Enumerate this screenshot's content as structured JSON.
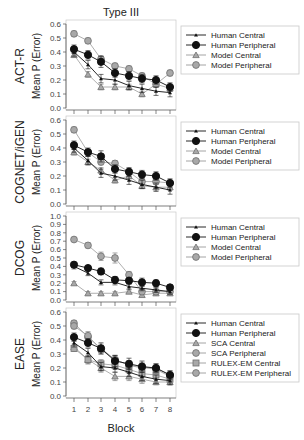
{
  "chart_data": {
    "type": "line",
    "title": "Type III",
    "xlabel": "Block",
    "ylabel": "Mean P (Error)",
    "x": [
      1,
      2,
      3,
      4,
      5,
      6,
      7,
      8
    ],
    "panels": [
      {
        "row_label": "ACT-R",
        "ylim": [
          0.0,
          0.6
        ],
        "yticks": [
          "0.0",
          "0.1",
          "0.2",
          "0.3",
          "0.4",
          "0.5",
          "0.6"
        ],
        "series": [
          {
            "name": "Human Central",
            "marker": "tri-small",
            "values": [
              0.4,
              0.31,
              0.21,
              0.2,
              0.16,
              0.14,
              0.12,
              0.11
            ],
            "err": [
              0.03,
              0.03,
              0.03,
              0.03,
              0.03,
              0.03,
              0.03,
              0.03
            ]
          },
          {
            "name": "Human Peripheral",
            "marker": "circle-black",
            "values": [
              0.42,
              0.38,
              0.33,
              0.25,
              0.23,
              0.21,
              0.2,
              0.15
            ],
            "err": [
              0.03,
              0.03,
              0.04,
              0.03,
              0.03,
              0.03,
              0.03,
              0.03
            ]
          },
          {
            "name": "Model Central",
            "marker": "tri-gray",
            "values": [
              0.38,
              0.24,
              0.15,
              0.15,
              0.15,
              0.1,
              0.17,
              0.14
            ],
            "err": [
              0.02,
              0.02,
              0.02,
              0.02,
              0.02,
              0.02,
              0.02,
              0.02
            ]
          },
          {
            "name": "Model Peripheral",
            "marker": "circle-gray",
            "values": [
              0.53,
              0.48,
              0.35,
              0.3,
              0.28,
              0.23,
              0.17,
              0.25
            ],
            "err": [
              0.02,
              0.02,
              0.02,
              0.02,
              0.02,
              0.02,
              0.02,
              0.02
            ]
          }
        ]
      },
      {
        "row_label": "COGNET/iGEN",
        "ylim": [
          0.0,
          0.6
        ],
        "yticks": [
          "0.0",
          "0.1",
          "0.2",
          "0.3",
          "0.4",
          "0.5",
          "0.6"
        ],
        "series": [
          {
            "name": "Human Central",
            "marker": "tri-small",
            "values": [
              0.4,
              0.31,
              0.22,
              0.2,
              0.17,
              0.14,
              0.12,
              0.1
            ],
            "err": [
              0.03,
              0.03,
              0.03,
              0.03,
              0.03,
              0.03,
              0.03,
              0.03
            ]
          },
          {
            "name": "Human Peripheral",
            "marker": "circle-black",
            "values": [
              0.42,
              0.37,
              0.34,
              0.25,
              0.23,
              0.21,
              0.2,
              0.15
            ],
            "err": [
              0.03,
              0.03,
              0.04,
              0.03,
              0.03,
              0.03,
              0.03,
              0.03
            ]
          },
          {
            "name": "Model Central",
            "marker": "tri-gray",
            "values": [
              0.37,
              0.3,
              0.24,
              0.17,
              0.2,
              0.13,
              0.12,
              0.12
            ],
            "err": [
              0.02,
              0.02,
              0.02,
              0.02,
              0.02,
              0.02,
              0.02,
              0.02
            ]
          },
          {
            "name": "Model Peripheral",
            "marker": "circle-gray",
            "values": [
              0.53,
              0.37,
              0.3,
              0.29,
              0.23,
              0.16,
              0.16,
              0.15
            ],
            "err": [
              0.02,
              0.02,
              0.02,
              0.02,
              0.02,
              0.02,
              0.02,
              0.02
            ]
          }
        ]
      },
      {
        "row_label": "DCOG",
        "ylim": [
          0.0,
          1.0
        ],
        "yticks": [
          "0.0",
          "0.1",
          "0.2",
          "0.3",
          "0.4",
          "0.5",
          "0.6",
          "0.7",
          "0.8",
          "0.9",
          "1.0"
        ],
        "series": [
          {
            "name": "Human Central",
            "marker": "tri-small",
            "values": [
              0.4,
              0.32,
              0.21,
              0.21,
              0.16,
              0.14,
              0.12,
              0.1
            ],
            "err": [
              0.03,
              0.03,
              0.03,
              0.03,
              0.03,
              0.03,
              0.03,
              0.03
            ]
          },
          {
            "name": "Human Peripheral",
            "marker": "circle-black",
            "values": [
              0.42,
              0.38,
              0.34,
              0.24,
              0.23,
              0.21,
              0.2,
              0.15
            ],
            "err": [
              0.03,
              0.03,
              0.04,
              0.04,
              0.04,
              0.05,
              0.04,
              0.03
            ]
          },
          {
            "name": "Model Central",
            "marker": "tri-gray",
            "values": [
              0.2,
              0.08,
              0.08,
              0.08,
              0.1,
              0.06,
              0.08,
              0.08
            ],
            "err": [
              0.02,
              0.02,
              0.02,
              0.02,
              0.02,
              0.02,
              0.02,
              0.02
            ]
          },
          {
            "name": "Model Peripheral",
            "marker": "circle-gray",
            "values": [
              0.72,
              0.65,
              0.52,
              0.5,
              0.3,
              0.1,
              0.1,
              0.1
            ],
            "err": [
              0.02,
              0.03,
              0.05,
              0.06,
              0.04,
              0.03,
              0.03,
              0.03
            ]
          }
        ]
      },
      {
        "row_label": "EASE",
        "ylim": [
          0.0,
          0.6
        ],
        "yticks": [
          "0.0",
          "0.1",
          "0.2",
          "0.3",
          "0.4",
          "0.5",
          "0.6"
        ],
        "series": [
          {
            "name": "Human Central",
            "marker": "tri-small",
            "values": [
              0.38,
              0.31,
              0.21,
              0.2,
              0.17,
              0.14,
              0.12,
              0.11
            ],
            "err": [
              0.03,
              0.03,
              0.03,
              0.03,
              0.03,
              0.03,
              0.03,
              0.03
            ]
          },
          {
            "name": "Human Peripheral",
            "marker": "circle-black",
            "values": [
              0.42,
              0.38,
              0.34,
              0.25,
              0.23,
              0.21,
              0.2,
              0.15
            ],
            "err": [
              0.03,
              0.03,
              0.04,
              0.04,
              0.04,
              0.04,
              0.03,
              0.03
            ]
          },
          {
            "name": "SCA Central",
            "marker": "tri-gray",
            "values": [
              0.35,
              0.26,
              0.2,
              0.14,
              0.14,
              0.12,
              0.1,
              0.1
            ],
            "err": [
              0.02,
              0.03,
              0.03,
              0.03,
              0.03,
              0.03,
              0.02,
              0.02
            ]
          },
          {
            "name": "SCA Peripheral",
            "marker": "circle-gray",
            "values": [
              0.52,
              0.42,
              0.34,
              0.26,
              0.22,
              0.2,
              0.2,
              0.15
            ],
            "err": [
              0.02,
              0.03,
              0.03,
              0.03,
              0.03,
              0.03,
              0.03,
              0.03
            ]
          },
          {
            "name": "RULEX-EM Central",
            "marker": "square-gray",
            "values": [
              0.34,
              0.26,
              0.23,
              0.22,
              0.19,
              0.16,
              0.15,
              0.12
            ],
            "err": [
              0.02,
              0.03,
              0.03,
              0.03,
              0.03,
              0.03,
              0.03,
              0.03
            ]
          },
          {
            "name": "RULEX-EM Peripheral",
            "marker": "circle-gray",
            "values": [
              0.5,
              0.43,
              0.33,
              0.26,
              0.22,
              0.21,
              0.19,
              0.14
            ],
            "err": [
              0.02,
              0.03,
              0.03,
              0.03,
              0.03,
              0.03,
              0.03,
              0.03
            ]
          }
        ]
      }
    ],
    "legend_position": "right of each panel",
    "grid": false
  },
  "layout": {
    "panel_top": [
      24,
      120,
      216,
      312
    ],
    "panel_height": 84,
    "plot_left": 66,
    "plot_right": 176,
    "x_positions": [
      74,
      88,
      101,
      115,
      129,
      142,
      156,
      170
    ],
    "legend_left": 181,
    "legend_width": 118
  },
  "colors": {
    "axis": "#555555",
    "black_series": "#111111",
    "gray_line": "#9a9a9a",
    "gray_marker_fill": "#a8a8a8",
    "gray_marker_stroke": "#6e6e6e",
    "frame": "#c8c8c8"
  }
}
